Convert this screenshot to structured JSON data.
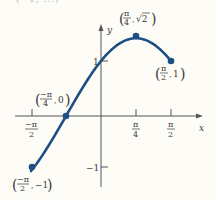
{
  "page": {
    "clipped_text": "(−1, ...)"
  },
  "chart_data": {
    "type": "line",
    "title": "",
    "xlabel": "x",
    "ylabel": "y",
    "curve_color": "#1d4e84",
    "axis_color": "#555555",
    "x_ticks": [
      {
        "value": -1.5708,
        "label_num": "−π",
        "label_den": "2"
      },
      {
        "value": 0.7854,
        "label_num": "π",
        "label_den": "4"
      },
      {
        "value": 1.5708,
        "label_num": "π",
        "label_den": "2"
      }
    ],
    "y_ticks": [
      {
        "value": 1,
        "label": "1"
      },
      {
        "value": -1,
        "label": "−1"
      }
    ],
    "xlim": [
      -1.6,
      2.0
    ],
    "ylim": [
      -1.4,
      1.8
    ],
    "function": "y = sin(x) + cos(x)",
    "x": [
      -1.5708,
      -1.2,
      -0.7854,
      -0.4,
      0,
      0.4,
      0.7854,
      1.2,
      1.5708
    ],
    "y": [
      -1,
      -0.57,
      0,
      0.532,
      1,
      1.31,
      1.4142,
      1.294,
      1
    ],
    "points": [
      {
        "x": -1.5708,
        "y": -1,
        "label": "(−π/2, −1)"
      },
      {
        "x": -0.7854,
        "y": 0,
        "label": "(−π/4, 0)"
      },
      {
        "x": 0.7854,
        "y": 1.4142,
        "label": "(π/4, √2)"
      },
      {
        "x": 1.5708,
        "y": 1,
        "label": "(π/2, 1)"
      }
    ]
  }
}
